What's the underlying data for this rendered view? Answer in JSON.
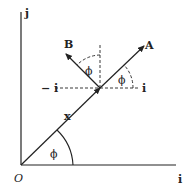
{
  "diagram": {
    "labels": {
      "j_axis": "j",
      "i_axis": "i",
      "origin": "O",
      "vector_x": "x",
      "vector_A": "A",
      "vector_B": "B",
      "angle_origin": "ϕ",
      "angle_A": "ϕ",
      "angle_B": "ϕ",
      "local_i": "i",
      "local_neg_i": "− i"
    },
    "colors": {
      "line": "#222222",
      "background": "#ffffff"
    }
  }
}
